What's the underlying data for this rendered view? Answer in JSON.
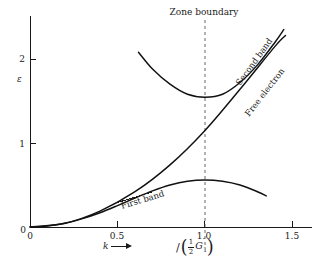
{
  "figure": {
    "title": "",
    "background_color": "#ffffff",
    "curve_color": "#111111",
    "axis_color": "#1a1a1a",
    "dash_color": "#555555"
  },
  "axes": {
    "x": {
      "label": "k",
      "arrow_glyph": "arrow-right",
      "ticks": [
        "0",
        "0.5",
        "1.0",
        "1.5"
      ],
      "tick_values": [
        0,
        0.5,
        1.0,
        1.5
      ],
      "range": [
        0,
        1.6
      ],
      "zone_expression": {
        "slash": "\\",
        "open_paren": "(",
        "numerator": "1",
        "denominator": "2",
        "symbol": "G",
        "subscript": "1",
        "close_paren": ")"
      }
    },
    "y": {
      "label": "ε",
      "ticks": [
        "0",
        "1",
        "2"
      ],
      "tick_values": [
        0,
        1,
        2
      ],
      "range": [
        0,
        2.35
      ]
    }
  },
  "annotations": {
    "zone_boundary": "Zone boundary",
    "first_band": "First band",
    "second_band": "Second band",
    "free_electron": "Free electron"
  },
  "chart_data": {
    "type": "line",
    "title": "",
    "xlabel": "k",
    "ylabel": "ε",
    "xlim": [
      0,
      1.6
    ],
    "ylim": [
      0,
      2.35
    ],
    "xticks": [
      0,
      0.5,
      1.0,
      1.5
    ],
    "yticks": [
      0,
      1,
      2
    ],
    "grid": false,
    "legend": "inline-curve-labels",
    "zone_boundary_x": 1.0,
    "series": [
      {
        "name": "First band",
        "label_position": [
          0.62,
          0.22
        ],
        "x": [
          0.0,
          0.1,
          0.2,
          0.3,
          0.4,
          0.5,
          0.6,
          0.7,
          0.8,
          0.9,
          1.0,
          1.1,
          1.2,
          1.3,
          1.35
        ],
        "y": [
          0.0,
          0.012,
          0.045,
          0.1,
          0.17,
          0.255,
          0.345,
          0.43,
          0.5,
          0.545,
          0.56,
          0.545,
          0.5,
          0.42,
          0.37
        ]
      },
      {
        "name": "Second band",
        "label_position": [
          1.12,
          1.78
        ],
        "x": [
          0.62,
          0.7,
          0.8,
          0.9,
          1.0,
          1.1,
          1.2,
          1.3,
          1.4,
          1.45
        ],
        "y": [
          2.08,
          1.88,
          1.7,
          1.58,
          1.545,
          1.58,
          1.72,
          1.93,
          2.2,
          2.35
        ]
      },
      {
        "name": "Free electron",
        "label_position": [
          1.17,
          1.47
        ],
        "x": [
          0.0,
          0.2,
          0.4,
          0.6,
          0.8,
          1.0,
          1.2,
          1.4,
          1.46
        ],
        "y": [
          0.0,
          0.045,
          0.19,
          0.42,
          0.74,
          1.15,
          1.64,
          2.15,
          2.28
        ]
      }
    ]
  }
}
